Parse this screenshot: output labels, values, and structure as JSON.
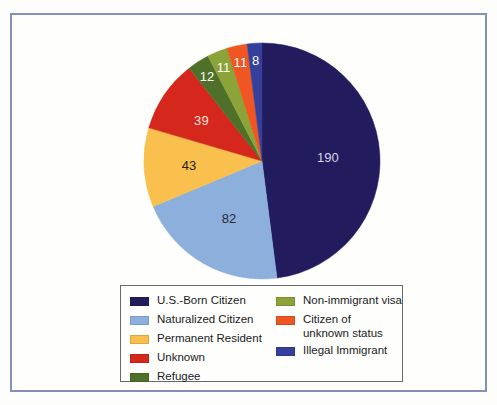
{
  "frame": {
    "border_color": "#8491b4",
    "background": "#fefefd"
  },
  "chart_data": {
    "type": "pie",
    "title": "",
    "subtitle": "",
    "xlabel": "",
    "ylabel": "",
    "total": 396,
    "start_angle_deg": 0,
    "direction": "clockwise",
    "legend_position": "bottom",
    "grid": false,
    "categories": [
      "U.S.-Born Citizen",
      "Naturalized Citizen",
      "Permanent Resident",
      "Unknown",
      "Refugee",
      "Non-immigrant visa",
      "Citizen of unknown status",
      "Illegal Immigrant"
    ],
    "values": [
      190,
      82,
      43,
      39,
      12,
      11,
      11,
      8
    ],
    "colors": [
      "#221b5e",
      "#8cafdc",
      "#f9c04d",
      "#d5271c",
      "#4e7029",
      "#8ca33a",
      "#ef5621",
      "#34409a"
    ],
    "slices": [
      {
        "label": "U.S.-Born Citizen",
        "value": 190,
        "color": "#221b5e",
        "data_label": "190",
        "data_label_color": "#d7d7e6"
      },
      {
        "label": "Naturalized Citizen",
        "value": 82,
        "color": "#8cafdc",
        "data_label": "82",
        "data_label_color": "#2a2a3a"
      },
      {
        "label": "Permanent Resident",
        "value": 43,
        "color": "#f9c04d",
        "data_label": "43",
        "data_label_color": "#2a2010"
      },
      {
        "label": "Unknown",
        "value": 39,
        "color": "#d5271c",
        "data_label": "39",
        "data_label_color": "#f4e3dd"
      },
      {
        "label": "Refugee",
        "value": 12,
        "color": "#4e7029",
        "data_label": "12",
        "data_label_color": "#ffffff"
      },
      {
        "label": "Non-immigrant visa",
        "value": 11,
        "color": "#8ca33a",
        "data_label": "11",
        "data_label_color": "#ffffff"
      },
      {
        "label": "Citizen of unknown status",
        "value": 11,
        "color": "#ef5621",
        "data_label": "11",
        "data_label_color": "#ffffff"
      },
      {
        "label": "Illegal Immigrant",
        "value": 8,
        "color": "#34409a",
        "data_label": "8",
        "data_label_color": "#ffffff"
      }
    ]
  },
  "legend": {
    "columns": [
      {
        "items": [
          {
            "label": "U.S.-Born Citizen",
            "color": "#221b5e"
          },
          {
            "label": "Naturalized Citizen",
            "color": "#8cafdc"
          },
          {
            "label": "Permanent Resident",
            "color": "#f9c04d"
          },
          {
            "label": "Unknown",
            "color": "#d5271c"
          },
          {
            "label": "Refugee",
            "color": "#4e7029"
          }
        ]
      },
      {
        "items": [
          {
            "label": "Non-immigrant visa",
            "color": "#8ca33a"
          },
          {
            "label": "Citizen of\nunknown status",
            "color": "#ef5621"
          },
          {
            "label": "Illegal Immigrant",
            "color": "#34409a"
          }
        ]
      }
    ]
  }
}
